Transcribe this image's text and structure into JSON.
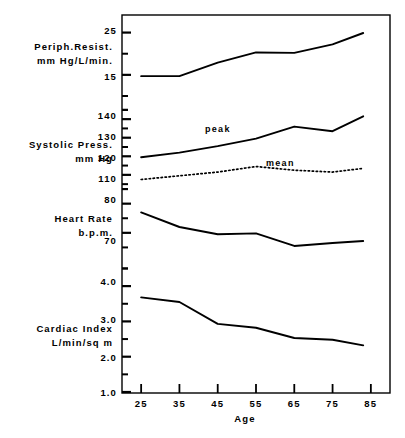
{
  "figure": {
    "background": "#ffffff",
    "ink": "#000000",
    "frame": {
      "left": 122,
      "top": 15,
      "right": 390,
      "bottom": 393
    }
  },
  "xaxis": {
    "title": "Age",
    "ticks": [
      "25",
      "35",
      "45",
      "55",
      "65",
      "75",
      "85"
    ],
    "values": [
      25,
      35,
      45,
      55,
      65,
      75,
      85
    ],
    "min": 20,
    "max": 90
  },
  "panels": [
    {
      "id": "periph-resist",
      "label_line1": "Periph.Resist.",
      "label_line2": "mm Hg/L/min.",
      "unit": "mm Hg/L/min.",
      "major_ticks": [
        "25",
        "15"
      ],
      "major_values": [
        25,
        15
      ]
    },
    {
      "id": "systolic-press",
      "label_line1": "Systolic Press.",
      "label_line2": "mm Hg",
      "unit": "mm Hg",
      "major_ticks": [
        "140",
        "130",
        "120",
        "110"
      ],
      "major_values": [
        140,
        130,
        120,
        110
      ]
    },
    {
      "id": "heart-rate",
      "label_line1": "Heart Rate",
      "label_line2": "b.p.m.",
      "unit": "b.p.m.",
      "major_ticks": [
        "80",
        "70"
      ],
      "major_values": [
        80,
        70
      ]
    },
    {
      "id": "cardiac-index",
      "label_line1": "Cardiac Index",
      "label_line2": "L/min/sq m",
      "unit": "L/min/sq m",
      "major_ticks": [
        "4.0",
        "3.0",
        "2.0",
        "1.0"
      ],
      "major_values": [
        4.0,
        3.0,
        2.0,
        1.0
      ]
    }
  ],
  "annotations": {
    "peak": "peak",
    "mean": "mean"
  },
  "chart_data": {
    "type": "line",
    "title": "",
    "subtitle": "",
    "xlabel": "Age",
    "ylabel": "",
    "grid": false,
    "legend": "inline-annotations",
    "x": [
      25,
      35,
      45,
      55,
      65,
      75,
      85
    ],
    "xlim": [
      20,
      90
    ],
    "panels": [
      {
        "name": "Peripheral Resistance",
        "ylabel": "Periph.Resist. mm Hg/L/min.",
        "units": "mm Hg/L/min.",
        "ylim": [
          10,
          27.5
        ],
        "yticks": [
          15,
          25
        ],
        "series": [
          {
            "name": "Peripheral Resistance",
            "style": "solid",
            "x": [
              25,
              35,
              45,
              55,
              65,
              75,
              83
            ],
            "values": [
              14.7,
              14.7,
              17.9,
              20.3,
              20.2,
              22.2,
              24.9
            ]
          }
        ]
      },
      {
        "name": "Systolic Pressure",
        "ylabel": "Systolic Press. mm Hg",
        "units": "mm Hg",
        "ylim": [
          104,
          146
        ],
        "yticks": [
          110,
          120,
          130,
          140
        ],
        "series": [
          {
            "name": "peak",
            "style": "solid",
            "x": [
              25,
              35,
              45,
              55,
              65,
              75,
              83
            ],
            "values": [
              119.5,
              122.0,
              125.5,
              129.5,
              136.0,
              133.5,
              141.5
            ]
          },
          {
            "name": "mean",
            "style": "dotted",
            "x": [
              25,
              35,
              45,
              55,
              65,
              75,
              83
            ],
            "values": [
              107.5,
              109.5,
              111.5,
              114.5,
              112.5,
              111.5,
              113.5
            ]
          }
        ]
      },
      {
        "name": "Heart Rate",
        "ylabel": "Heart Rate b.p.m.",
        "units": "b.p.m.",
        "ylim": [
          60,
          84
        ],
        "yticks": [
          70,
          80
        ],
        "series": [
          {
            "name": "Heart Rate",
            "style": "solid",
            "x": [
              25,
              35,
              45,
              55,
              65,
              75,
              83
            ],
            "values": [
              77.0,
              72.0,
              69.5,
              69.8,
              65.5,
              66.5,
              67.2
            ]
          }
        ]
      },
      {
        "name": "Cardiac Index",
        "ylabel": "Cardiac Index L/min/sq m",
        "units": "L/min/sq m",
        "ylim": [
          1.0,
          4.4
        ],
        "yticks": [
          1.0,
          2.0,
          3.0,
          4.0
        ],
        "series": [
          {
            "name": "Cardiac Index",
            "style": "solid",
            "x": [
              25,
              35,
              45,
              55,
              65,
              75,
              83
            ],
            "values": [
              3.68,
              3.55,
              2.93,
              2.82,
              2.53,
              2.48,
              2.32
            ]
          }
        ]
      }
    ]
  }
}
